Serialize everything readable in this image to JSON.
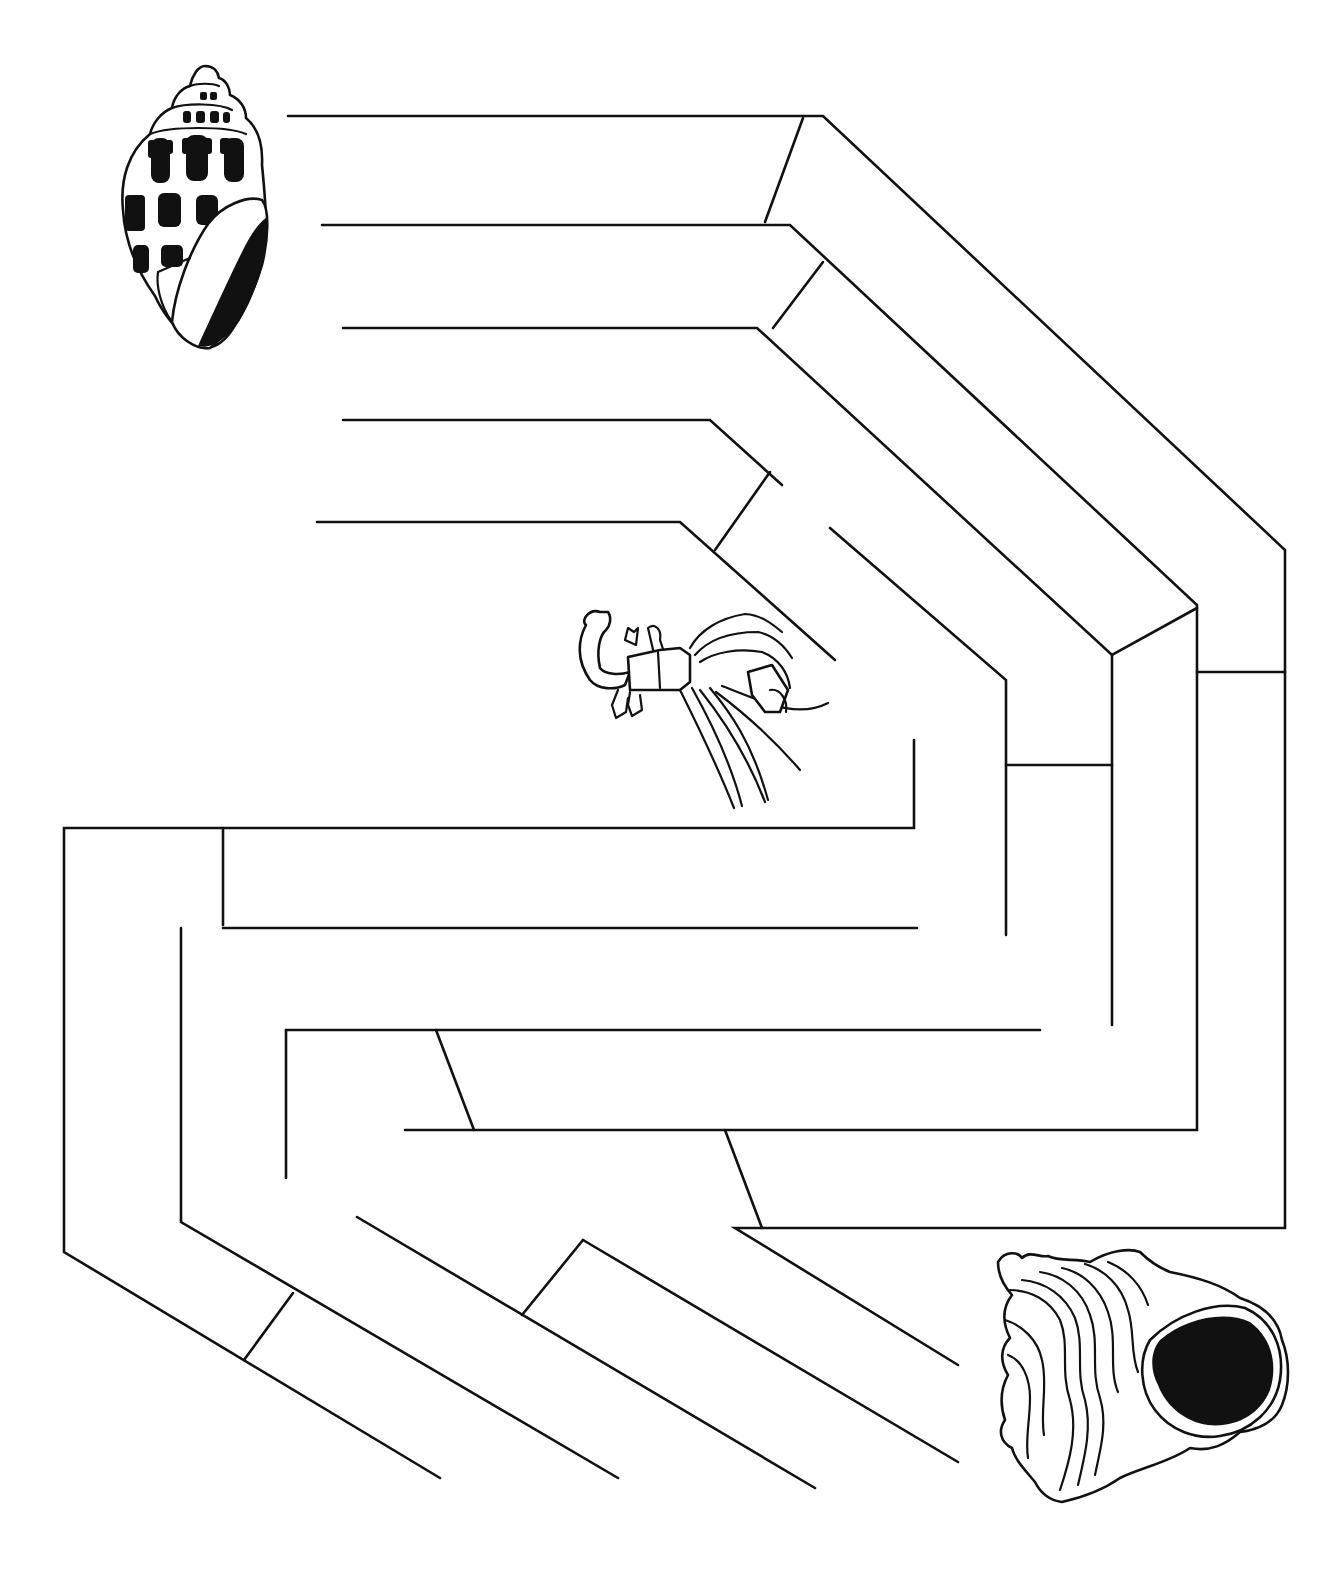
{
  "puzzle": {
    "type": "maze",
    "ink_color": "#111111",
    "background_color": "#ffffff",
    "start": {
      "icon": "spotted-cone-shell-icon",
      "x": 195,
      "y": 205
    },
    "middle": {
      "icon": "hermit-crab-icon",
      "x": 700,
      "y": 700
    },
    "finish": {
      "icon": "murex-shell-icon",
      "x": 1140,
      "y": 1375
    }
  },
  "walls": [
    [
      [
        288,
        116
      ],
      [
        823,
        116
      ],
      [
        1285,
        550
      ],
      [
        1285,
        1228
      ],
      [
        735,
        1228
      ],
      [
        958,
        1365
      ]
    ],
    [
      [
        803,
        118
      ],
      [
        765,
        222
      ]
    ],
    [
      [
        322,
        225
      ],
      [
        790,
        225
      ],
      [
        1197,
        605
      ],
      [
        1197,
        1130
      ],
      [
        405,
        1130
      ]
    ],
    [
      [
        823,
        262
      ],
      [
        773,
        328
      ]
    ],
    [
      [
        343,
        328
      ],
      [
        757,
        328
      ],
      [
        1112,
        655
      ],
      [
        1197,
        608
      ]
    ],
    [
      [
        1112,
        655
      ],
      [
        1112,
        1025
      ]
    ],
    [
      [
        343,
        420
      ],
      [
        710,
        420
      ],
      [
        782,
        485
      ]
    ],
    [
      [
        770,
        472
      ],
      [
        715,
        550
      ]
    ],
    [
      [
        317,
        522
      ],
      [
        680,
        522
      ],
      [
        835,
        660
      ]
    ],
    [
      [
        830,
        528
      ],
      [
        1006,
        680
      ],
      [
        1006,
        935
      ]
    ],
    [
      [
        1006,
        765
      ],
      [
        1112,
        765
      ]
    ],
    [
      [
        1197,
        672
      ],
      [
        1285,
        672
      ]
    ],
    [
      [
        914,
        740
      ],
      [
        914,
        828
      ],
      [
        64,
        828
      ],
      [
        64,
        1252
      ],
      [
        440,
        1478
      ]
    ],
    [
      [
        223,
        828
      ],
      [
        223,
        925
      ]
    ],
    [
      [
        223,
        928
      ],
      [
        917,
        928
      ]
    ],
    [
      [
        181,
        928
      ],
      [
        181,
        1222
      ],
      [
        618,
        1478
      ]
    ],
    [
      [
        286,
        1030
      ],
      [
        1040,
        1030
      ]
    ],
    [
      [
        286,
        1030
      ],
      [
        286,
        1178
      ]
    ],
    [
      [
        436,
        1030
      ],
      [
        474,
        1130
      ]
    ],
    [
      [
        725,
        1130
      ],
      [
        762,
        1228
      ]
    ],
    [
      [
        357,
        1217
      ],
      [
        815,
        1488
      ]
    ],
    [
      [
        293,
        1293
      ],
      [
        244,
        1360
      ]
    ],
    [
      [
        583,
        1240
      ],
      [
        958,
        1462
      ]
    ],
    [
      [
        583,
        1240
      ],
      [
        522,
        1315
      ]
    ]
  ]
}
